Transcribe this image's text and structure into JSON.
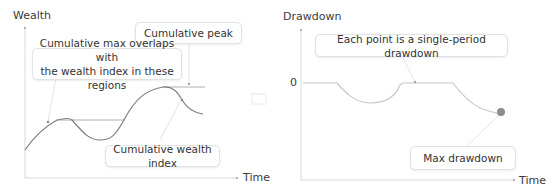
{
  "left_chart": {
    "y_axis_label": "Wealth",
    "x_axis_label": "Time",
    "callouts": {
      "cumulative_peak": "Cumulative peak",
      "overlap_line1": "Cumulative max overlaps with",
      "overlap_line2": "the wealth index in these regions",
      "wealth_index": "Cumulative wealth index"
    }
  },
  "right_chart": {
    "y_axis_label": "Drawdown",
    "x_axis_label": "Time",
    "zero_tick": "0",
    "callouts": {
      "single_period": "Each point is a single-period drawdown",
      "max_drawdown": "Max drawdown"
    }
  },
  "colors": {
    "axis": "#d9d9d9",
    "curve": "#7f7f7f",
    "drawdown_curve": "#c8c8c8",
    "max_point": "#8c8c8c"
  }
}
